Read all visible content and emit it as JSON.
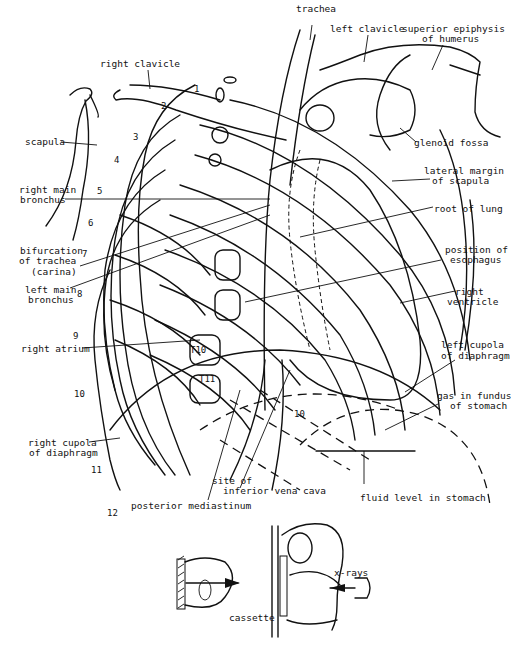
{
  "figure": {
    "labels": {
      "trachea": "trachea",
      "left_clavicle": "left clavicle",
      "superior_epiphysis_1": "superior epiphysis",
      "superior_epiphysis_2": "of humerus",
      "right_clavicle": "right clavicle",
      "scapula": "scapula",
      "glenoid_fossa": "glenoid fossa",
      "lateral_margin_1": "lateral margin",
      "lateral_margin_2": "of scapula",
      "right_main_bronchus_1": "right main",
      "right_main_bronchus_2": "bronchus",
      "root_of_lung": "root of lung",
      "bifurcation_1": "bifurcation",
      "bifurcation_2": "of trachea",
      "bifurcation_3": "(carina)",
      "position_esophagus_1": "position of",
      "position_esophagus_2": "esophagus",
      "left_main_bronchus_1": "left main",
      "left_main_bronchus_2": "bronchus",
      "right_ventricle_1": "right",
      "right_ventricle_2": "ventricle",
      "right_atrium": "right atrium",
      "left_cupola_1": "left cupola",
      "left_cupola_2": "of diaphragm",
      "gas_fundus_1": "gas in fundus",
      "gas_fundus_2": "of stomach",
      "right_cupola_1": "right cupola",
      "right_cupola_2": "of diaphragm",
      "site_ivc_1": "site of",
      "site_ivc_2": "inferior vena cava",
      "fluid_level": "fluid level in stomach",
      "posterior_mediastinum": "posterior mediastinum",
      "x_rays": "x-rays",
      "cassette": "cassette"
    },
    "rib_numbers": [
      "1",
      "2",
      "3",
      "4",
      "5",
      "6",
      "7",
      "8",
      "9",
      "10",
      "11",
      "12"
    ],
    "vertebra_labels": [
      "T10",
      "T11"
    ],
    "inner_rib_number": "10"
  }
}
